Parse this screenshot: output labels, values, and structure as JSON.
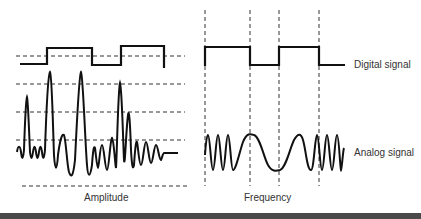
{
  "diagram": {
    "left_panel": {
      "caption": "Amplitude",
      "description": "Amplitude modulation: digital signal changes the amplitude of the carrier"
    },
    "right_panel": {
      "caption": "Frequency",
      "description": "Frequency modulation: digital signal changes the frequency of the carrier"
    },
    "labels": {
      "digital_signal": "Digital signal",
      "analog_signal": "Analog signal"
    },
    "colors": {
      "stroke": "#111111",
      "text": "#333333",
      "background": "#ffffff",
      "bottom_bar": "#4a4a4a"
    }
  }
}
